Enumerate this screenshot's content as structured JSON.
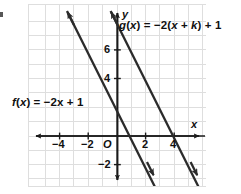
{
  "figure": {
    "type": "coordinate-plane-graph",
    "background_color": "#ffffff",
    "grid_color": "#dcdcdc",
    "axis_color": "#1a1a1a",
    "line_color": "#2b2b2b",
    "origin_label": "O",
    "axis_labels": {
      "x": "x",
      "y": "y"
    },
    "x_ticks": [
      "-4",
      "-2",
      "2",
      "4"
    ],
    "y_ticks": [
      "6",
      "4",
      "-2"
    ],
    "function_labels": {
      "f": "f(x) = -2x + 1",
      "g": "g(x) = -2(x + k) + 1"
    }
  },
  "chart_data": {
    "type": "line",
    "title": "",
    "xlabel": "x",
    "ylabel": "y",
    "xlim": [
      -6.2,
      6.2
    ],
    "ylim": [
      -3.5,
      9.2
    ],
    "grid": true,
    "xticks": [
      -4,
      -2,
      2,
      4
    ],
    "xticklabels": [
      "-4",
      "-2",
      "2",
      "4"
    ],
    "yticks": [
      6,
      4,
      -2
    ],
    "yticklabels": [
      "6",
      "4",
      "-2"
    ],
    "origin_tick_label": "O",
    "legend": "none",
    "annotations": [
      {
        "text": "f(x) = -2x + 1",
        "x": -5.9,
        "y": 3.7
      },
      {
        "text": "g(x) = -2(x + k) + 1",
        "x": 0.2,
        "y": 8.0
      }
    ],
    "series": [
      {
        "name": "f(x) = -2x + 1",
        "slope": -2,
        "intercept": 1,
        "arrows": "both",
        "points": [
          [
            -3.5,
            8.0
          ],
          [
            3.0,
            -5.0
          ]
        ]
      },
      {
        "name": "g(x) = -2(x + k) + 1",
        "slope": -2,
        "intercept": -5,
        "arrows": "both",
        "points": [
          [
            -0.5,
            6.0
          ],
          [
            5.9,
            -6.8
          ]
        ]
      }
    ]
  }
}
